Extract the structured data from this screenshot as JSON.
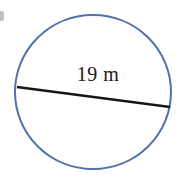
{
  "figure": {
    "type": "geometry-diagram",
    "shape": "circle",
    "background_color": "#ffffff",
    "circle": {
      "stroke_color": "#4f72a8",
      "stroke_width": 2,
      "fill": "none",
      "center_x": 93,
      "center_y": 92,
      "radius_x": 78,
      "radius_y": 77
    },
    "diameter_segment": {
      "name": "diameter",
      "stroke_color": "#161616",
      "stroke_width": 2.4,
      "x1": 17,
      "y1": 87,
      "x2": 170,
      "y2": 107
    },
    "measurement": {
      "value": "19",
      "unit": "m",
      "label": "19 m",
      "text_color": "#1a1a1a"
    },
    "corner_mark": {
      "description": "cropped-glyph-fragment",
      "color": "#8d8d8d"
    }
  },
  "chart_data": {
    "type": "diagram",
    "title": "",
    "shape": "circle",
    "annotations": [
      {
        "label": "19 m",
        "measures": "diameter",
        "value": 19,
        "unit": "m"
      }
    ],
    "legend": [],
    "xlabel": "",
    "ylabel": ""
  }
}
